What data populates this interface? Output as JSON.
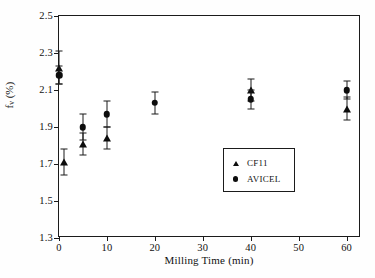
{
  "chart_data": {
    "type": "scatter",
    "title": "",
    "xlabel": "Milling Time (min)",
    "ylabel": "f_v (%)",
    "ylabel_base": "f",
    "ylabel_sub": "v",
    "ylabel_unit": " (%)",
    "xlim": [
      0,
      63
    ],
    "ylim": [
      1.3,
      2.5
    ],
    "xticks": [
      0,
      10,
      20,
      30,
      40,
      50,
      60
    ],
    "xtick_labels": [
      "0",
      "10",
      "20",
      "30",
      "40",
      "50",
      "60"
    ],
    "yticks": [
      1.3,
      1.5,
      1.7,
      1.9,
      2.1,
      2.3,
      2.5
    ],
    "ytick_labels": [
      "1.3",
      "1.5",
      "1.7",
      "1.9",
      "2.1",
      "2.3",
      "2.5"
    ],
    "grid": false,
    "legend_position": "center-right",
    "error_bars": true,
    "series": [
      {
        "name": "CF11",
        "marker": "triangle",
        "color": "#0d0d0d",
        "points": [
          {
            "x": 0,
            "y": 2.22,
            "err": 0.09
          },
          {
            "x": 1,
            "y": 1.71,
            "err": 0.07
          },
          {
            "x": 5,
            "y": 1.81,
            "err": 0.06
          },
          {
            "x": 10,
            "y": 1.84,
            "err": 0.06
          },
          {
            "x": 40,
            "y": 2.1,
            "err": 0.06
          },
          {
            "x": 60,
            "y": 2.0,
            "err": 0.06
          }
        ]
      },
      {
        "name": "AVICEL",
        "marker": "circle",
        "color": "#0d0d0d",
        "points": [
          {
            "x": 0,
            "y": 2.18,
            "err": 0.05
          },
          {
            "x": 5,
            "y": 1.9,
            "err": 0.07
          },
          {
            "x": 10,
            "y": 1.97,
            "err": 0.07
          },
          {
            "x": 20,
            "y": 2.03,
            "err": 0.06
          },
          {
            "x": 40,
            "y": 2.05,
            "err": 0.05
          },
          {
            "x": 60,
            "y": 2.1,
            "err": 0.05
          }
        ]
      }
    ],
    "legend": [
      {
        "label": "CF11",
        "marker": "triangle"
      },
      {
        "label": "AVICEL",
        "marker": "circle"
      }
    ]
  }
}
